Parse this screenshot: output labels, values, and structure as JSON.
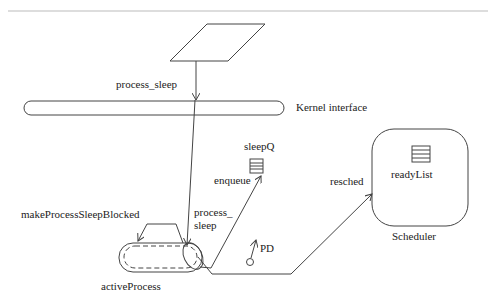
{
  "diagram": {
    "labels": {
      "process_sleep_top": "process_sleep",
      "kernel_interface": "Kernel interface",
      "sleepQ": "sleepQ",
      "enqueue": "enqueue",
      "resched": "resched",
      "readyList": "readyList",
      "scheduler": "Scheduler",
      "makeProcessSleepBlocked": "makeProcessSleepBlocked",
      "process_sleep_line1": "process_",
      "process_sleep_line2": "sleep",
      "pd": "PD",
      "activeProcess": "activeProcess"
    },
    "colors": {
      "stroke": "#444444",
      "text": "#222222",
      "rule": "#bbbbbb",
      "background": "#ffffff"
    }
  }
}
